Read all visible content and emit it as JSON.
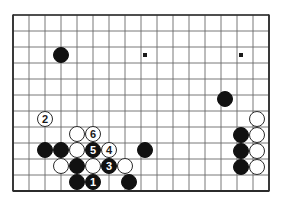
{
  "diagram": {
    "type": "go-board-problem-diagram",
    "board": {
      "origin_x": 13,
      "origin_y": 15,
      "spacing": 16,
      "cols": 17,
      "rows": 12,
      "stone_diameter": 16,
      "line_color": "#6a6a6a",
      "border_color": "#2b2b2b",
      "board_color": "#ffffff",
      "black_color": "#111111",
      "white_color": "#ffffff"
    },
    "star_points": [
      {
        "cx": 145,
        "cy": 55
      },
      {
        "cx": 241,
        "cy": 55
      }
    ],
    "stones": [
      {
        "id": "b-upper-left",
        "color": "black",
        "cx": 61,
        "cy": 55,
        "label": ""
      },
      {
        "id": "w-move-2",
        "color": "white",
        "cx": 45,
        "cy": 119,
        "label": "2"
      },
      {
        "id": "w-upper-group-a",
        "color": "white",
        "cx": 77,
        "cy": 134,
        "label": ""
      },
      {
        "id": "w-move-6",
        "color": "white",
        "cx": 93,
        "cy": 134,
        "label": "6"
      },
      {
        "id": "b-left-a",
        "color": "black",
        "cx": 45,
        "cy": 150,
        "label": ""
      },
      {
        "id": "b-left-b",
        "color": "black",
        "cx": 61,
        "cy": 150,
        "label": ""
      },
      {
        "id": "w-center-a",
        "color": "white",
        "cx": 77,
        "cy": 150,
        "label": ""
      },
      {
        "id": "b-move-5",
        "color": "black",
        "cx": 93,
        "cy": 150,
        "label": "5"
      },
      {
        "id": "w-move-4",
        "color": "white",
        "cx": 109,
        "cy": 150,
        "label": "4"
      },
      {
        "id": "b-center-right",
        "color": "black",
        "cx": 145,
        "cy": 150,
        "label": ""
      },
      {
        "id": "w-lower-a",
        "color": "white",
        "cx": 61,
        "cy": 166,
        "label": ""
      },
      {
        "id": "b-lower-a",
        "color": "black",
        "cx": 77,
        "cy": 166,
        "label": ""
      },
      {
        "id": "w-lower-b",
        "color": "white",
        "cx": 93,
        "cy": 166,
        "label": ""
      },
      {
        "id": "b-move-3",
        "color": "black",
        "cx": 109,
        "cy": 166,
        "label": "3"
      },
      {
        "id": "w-lower-c",
        "color": "white",
        "cx": 125,
        "cy": 166,
        "label": ""
      },
      {
        "id": "b-bottom-a",
        "color": "black",
        "cx": 77,
        "cy": 182,
        "label": ""
      },
      {
        "id": "b-move-1",
        "color": "black",
        "cx": 93,
        "cy": 182,
        "label": "1"
      },
      {
        "id": "b-bottom-b",
        "color": "black",
        "cx": 129,
        "cy": 182,
        "label": ""
      },
      {
        "id": "b-right-top",
        "color": "black",
        "cx": 225,
        "cy": 99,
        "label": ""
      },
      {
        "id": "w-right-a",
        "color": "white",
        "cx": 257,
        "cy": 119,
        "label": ""
      },
      {
        "id": "b-right-b",
        "color": "black",
        "cx": 241,
        "cy": 135,
        "label": ""
      },
      {
        "id": "w-right-b",
        "color": "white",
        "cx": 257,
        "cy": 135,
        "label": ""
      },
      {
        "id": "b-right-c",
        "color": "black",
        "cx": 241,
        "cy": 151,
        "label": ""
      },
      {
        "id": "w-right-c",
        "color": "white",
        "cx": 257,
        "cy": 151,
        "label": ""
      },
      {
        "id": "b-right-d",
        "color": "black",
        "cx": 241,
        "cy": 167,
        "label": ""
      },
      {
        "id": "w-right-d",
        "color": "white",
        "cx": 257,
        "cy": 167,
        "label": ""
      }
    ],
    "move_order": [
      "1",
      "2",
      "3",
      "4",
      "5",
      "6"
    ]
  }
}
